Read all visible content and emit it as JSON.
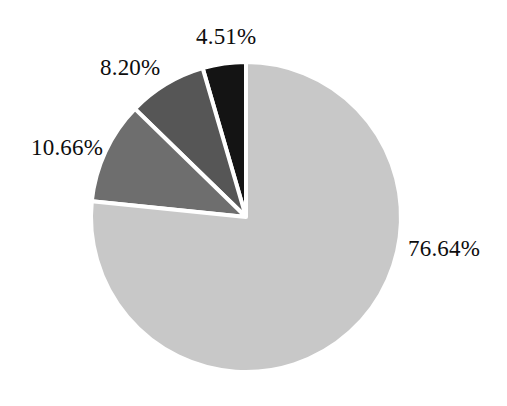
{
  "chart_data": {
    "type": "pie",
    "title": "",
    "subtitle": "",
    "xlabel": "",
    "ylabel": "",
    "legend": "none",
    "grid": false,
    "value_unit": "%",
    "label_format": "{value}%",
    "total": 100.01,
    "start_angle_deg": 90,
    "direction": "counterclockwise",
    "categories": [
      "4.51%",
      "8.20%",
      "10.66%",
      "76.64%"
    ],
    "values": [
      4.51,
      8.2,
      10.66,
      76.64
    ],
    "slices": [
      {
        "index": 0,
        "label": "4.51%",
        "value": 4.51,
        "color": "#141414",
        "color_name": "black",
        "start_angle_deg": 90,
        "end_angle_deg": 106.24,
        "label_position": "top"
      },
      {
        "index": 1,
        "label": "8.20%",
        "value": 8.2,
        "color": "#565656",
        "color_name": "dark-gray",
        "start_angle_deg": 106.24,
        "end_angle_deg": 135.76,
        "label_position": "upper-left"
      },
      {
        "index": 2,
        "label": "10.66%",
        "value": 10.66,
        "color": "#6e6e6e",
        "color_name": "medium-gray",
        "start_angle_deg": 135.76,
        "end_angle_deg": 174.14,
        "label_position": "left"
      },
      {
        "index": 3,
        "label": "76.64%",
        "value": 76.64,
        "color": "#c8c8c8",
        "color_name": "light-gray",
        "start_angle_deg": 174.14,
        "end_angle_deg": 450,
        "label_position": "right"
      }
    ],
    "geometry": {
      "center_x": 246,
      "center_y": 217,
      "radius": 155,
      "separator_color": "#ffffff",
      "separator_width": 4
    },
    "background_color": "#ffffff",
    "text_color": "#0d0d0d"
  }
}
